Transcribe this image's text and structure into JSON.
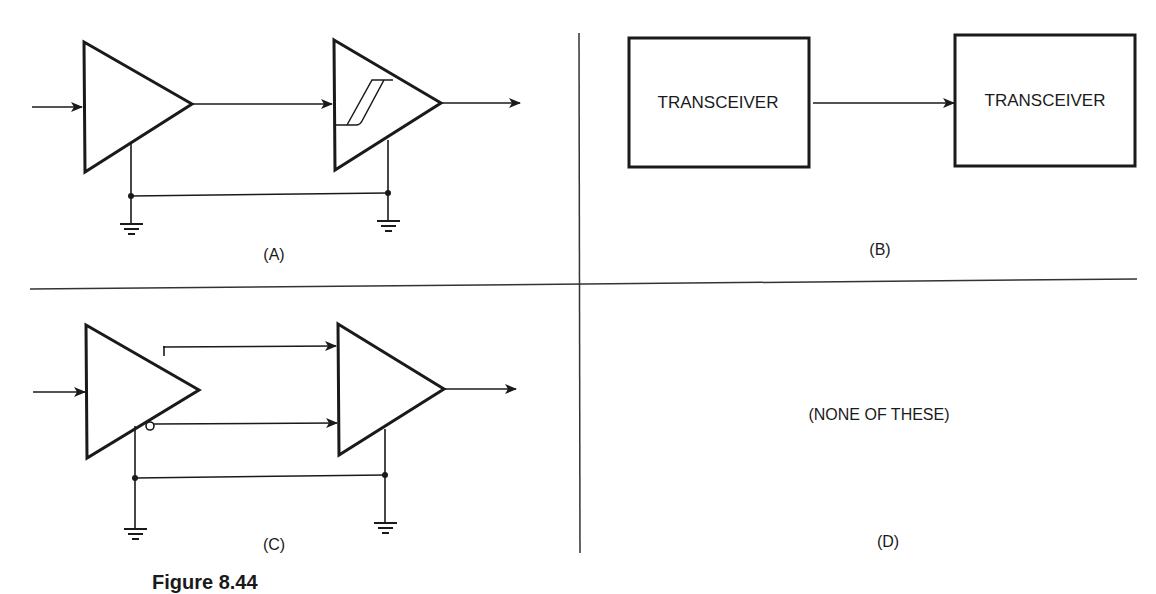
{
  "figure": {
    "caption": "Figure 8.44",
    "colors": {
      "ink": "#1a1a1a",
      "background": "#ffffff"
    }
  },
  "panels": {
    "a": {
      "label": "(A)",
      "description": "Amplifier driving Schmitt-trigger amplifier, shared ground"
    },
    "b": {
      "label": "(B)",
      "box_left": "TRANSCEIVER",
      "box_right": "TRANSCEIVER"
    },
    "c": {
      "label": "(C)",
      "description": "Differential driver (true and inverted outputs) to differential receiver, shared ground"
    },
    "d": {
      "label": "(D)",
      "text": "(NONE OF THESE)"
    }
  }
}
